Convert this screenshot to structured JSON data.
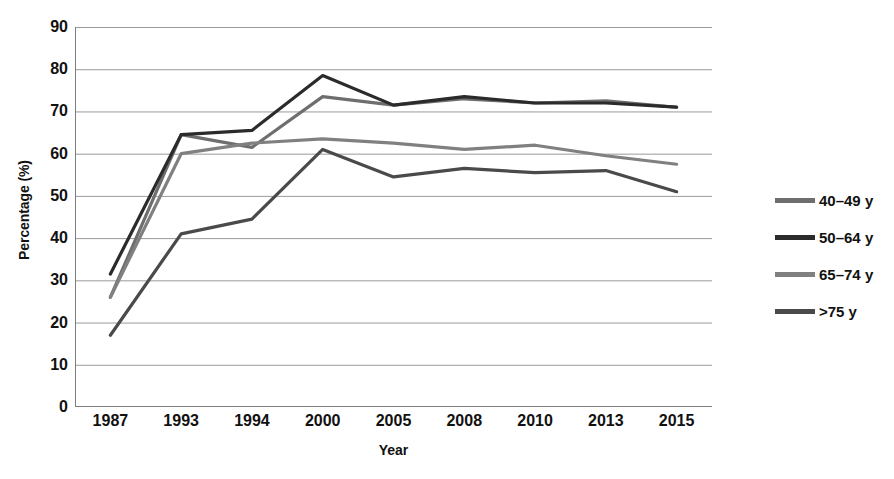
{
  "chart_data": {
    "type": "line",
    "title": "",
    "xlabel": "Year",
    "ylabel": "Percentage (%)",
    "categories": [
      "1987",
      "1993",
      "1994",
      "2000",
      "2005",
      "2008",
      "2010",
      "2013",
      "2015"
    ],
    "x": [
      "1987",
      "1993",
      "1994",
      "2000",
      "2005",
      "2008",
      "2010",
      "2013",
      "2015"
    ],
    "ylim": [
      0,
      90
    ],
    "xlim": [
      "1987",
      "2015"
    ],
    "yticks": [
      0,
      10,
      20,
      30,
      40,
      50,
      60,
      70,
      80,
      90
    ],
    "grid": true,
    "legend_position": "right",
    "series": [
      {
        "name": "40–49 y",
        "color": "#6e6e6e",
        "values": [
          26,
          64.5,
          61.5,
          73.5,
          71.5,
          73,
          72,
          72.5,
          71
        ]
      },
      {
        "name": "50–64 y",
        "color": "#2b2b2b",
        "values": [
          31.5,
          64.5,
          65.5,
          78.5,
          71.5,
          73.5,
          72,
          72,
          71
        ]
      },
      {
        "name": "65–74 y",
        "color": "#808080",
        "values": [
          26,
          60,
          62.5,
          63.5,
          62.5,
          61,
          62,
          59.5,
          57.5
        ]
      },
      {
        "name": ">75 y",
        "color": "#4a4a4a",
        "values": [
          17,
          41,
          44.5,
          61,
          54.5,
          56.5,
          55.5,
          56,
          51
        ]
      }
    ]
  },
  "axes": {
    "y_title": "Percentage (%)",
    "x_title": "Year",
    "y_tick_labels": [
      "90",
      "80",
      "70",
      "60",
      "50",
      "40",
      "30",
      "20",
      "10",
      "0"
    ],
    "x_tick_labels": [
      "1987",
      "1993",
      "1994",
      "2000",
      "2005",
      "2008",
      "2010",
      "2013",
      "2015"
    ]
  },
  "legend": {
    "items": [
      {
        "label": "40–49 y",
        "color": "#6e6e6e"
      },
      {
        "label": "50–64 y",
        "color": "#2b2b2b"
      },
      {
        "label": "65–74 y",
        "color": "#808080"
      },
      {
        "label": ">75 y",
        "color": "#4a4a4a"
      }
    ]
  },
  "style": {
    "background": "#ffffff",
    "gridline_color": "#9a9a9a",
    "axis_color": "#7d7d7d",
    "text_color": "#111111"
  }
}
